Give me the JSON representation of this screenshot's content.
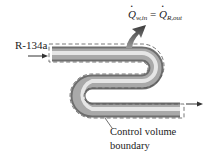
{
  "diagram": {
    "refrigerant_label": "R-134a",
    "equation": {
      "lhs_symbol": "Q",
      "lhs_subscript": "w,in",
      "equals": "=",
      "rhs_symbol": "Q",
      "rhs_subscript": "R,out"
    },
    "boundary_label_line1": "Control volume",
    "boundary_label_line2": "boundary",
    "icons": {
      "inlet": "arrow-right-icon",
      "outlet": "arrow-right-icon",
      "heat": "heat-flow-arrow-icon"
    },
    "colors": {
      "pipe_dark": "#6e6e6e",
      "pipe_light": "#e6e6e6",
      "boundary": "#555555",
      "text": "#222222"
    }
  }
}
